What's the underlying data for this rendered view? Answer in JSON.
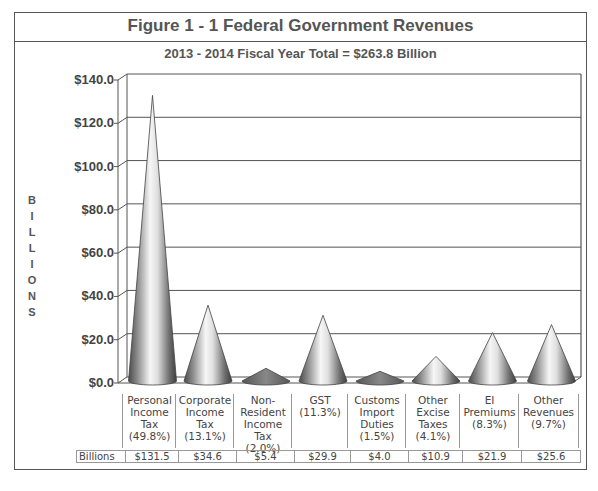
{
  "header": {
    "title": "Figure 1 - 1   Federal Government Revenues",
    "subtitle": "2013 - 2014 Fiscal Year   Total = $263.8 Billion"
  },
  "axis": {
    "ylabel_letters": [
      "B",
      "I",
      "L",
      "L",
      "I",
      "O",
      "N",
      "S"
    ],
    "ticks": [
      "$140.0",
      "$120.0",
      "$100.0",
      "$80.0",
      "$60.0",
      "$40.0",
      "$20.0",
      "$0.0"
    ]
  },
  "table": {
    "row_label": "Billions",
    "categories": [
      {
        "lines": [
          "Personal",
          "Income",
          "Tax",
          "(49.8%)"
        ],
        "value": "$131.5"
      },
      {
        "lines": [
          "Corporate",
          "Income",
          "Tax",
          "(13.1%)"
        ],
        "value": "$34.6"
      },
      {
        "lines": [
          "Non-",
          "Resident",
          "Income",
          "Tax",
          "(2.0%)"
        ],
        "value": "$5.4"
      },
      {
        "lines": [
          "GST",
          "(11.3%)"
        ],
        "value": "$29.9"
      },
      {
        "lines": [
          "Customs",
          "Import",
          "Duties",
          "(1.5%)"
        ],
        "value": "$4.0"
      },
      {
        "lines": [
          "Other",
          "Excise",
          "Taxes",
          "(4.1%)"
        ],
        "value": "$10.9"
      },
      {
        "lines": [
          "EI",
          "Premiums",
          "(8.3%)"
        ],
        "value": "$21.9"
      },
      {
        "lines": [
          "Other",
          "Revenues",
          "(9.7%)"
        ],
        "value": "$25.6"
      }
    ]
  },
  "colors": {
    "frame": "#555555",
    "cone_dark": "#555555",
    "cone_light": "#f4f4f4",
    "grid": "#555555"
  },
  "chart_data": {
    "type": "bar",
    "subtype": "3d-cone",
    "title": "Figure 1 - 1   Federal Government Revenues",
    "subtitle": "2013 - 2014 Fiscal Year   Total = $263.8 Billion",
    "xlabel": "",
    "ylabel": "BILLIONS",
    "categories": [
      "Personal Income Tax (49.8%)",
      "Corporate Income Tax (13.1%)",
      "Non-Resident Income Tax (2.0%)",
      "GST (11.3%)",
      "Customs Import Duties (1.5%)",
      "Other Excise Taxes (4.1%)",
      "EI Premiums (8.3%)",
      "Other Revenues (9.7%)"
    ],
    "series": [
      {
        "name": "Billions",
        "values": [
          131.5,
          34.6,
          5.4,
          29.9,
          4.0,
          10.9,
          21.9,
          25.6
        ]
      }
    ],
    "percentages": [
      49.8,
      13.1,
      2.0,
      11.3,
      1.5,
      4.1,
      8.3,
      9.7
    ],
    "ylim": [
      0,
      140
    ],
    "yticks": [
      0,
      20,
      40,
      60,
      80,
      100,
      120,
      140
    ],
    "grid": true,
    "legend": "data table below chart (row label: Billions)"
  }
}
